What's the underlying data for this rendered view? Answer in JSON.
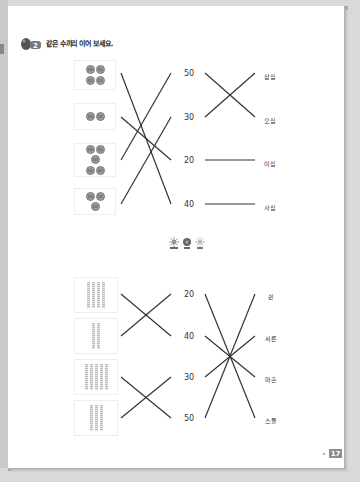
{
  "instruction": {
    "badge_number": "2",
    "text": "같은 수끼리 이어 보세요."
  },
  "section_top": {
    "boxes": [
      {
        "coin_count": 4,
        "coin_label": "10",
        "value": 40
      },
      {
        "coin_count": 2,
        "coin_label": "10",
        "value": 20
      },
      {
        "coin_count": 5,
        "coin_label": "10",
        "value": 50
      },
      {
        "coin_count": 3,
        "coin_label": "10",
        "value": 30
      }
    ],
    "numbers": [
      "50",
      "30",
      "20",
      "40"
    ],
    "words": [
      "삼십",
      "오십",
      "이십",
      "사십"
    ],
    "box_to_number": [
      [
        0,
        3
      ],
      [
        1,
        2
      ],
      [
        2,
        0
      ],
      [
        3,
        1
      ]
    ],
    "number_to_word": [
      [
        0,
        1
      ],
      [
        1,
        0
      ],
      [
        2,
        2
      ],
      [
        3,
        3
      ]
    ]
  },
  "section_bottom": {
    "boxes": [
      {
        "stick_count": 4,
        "value": 40
      },
      {
        "stick_count": 2,
        "value": 20
      },
      {
        "stick_count": 5,
        "value": 50
      },
      {
        "stick_count": 3,
        "value": 30
      }
    ],
    "numbers": [
      "20",
      "40",
      "30",
      "50"
    ],
    "words": [
      "쉰",
      "서른",
      "마흔",
      "스물"
    ],
    "box_to_number": [
      [
        0,
        1
      ],
      [
        1,
        0
      ],
      [
        2,
        3
      ],
      [
        3,
        2
      ]
    ],
    "number_to_word": [
      [
        0,
        3
      ],
      [
        1,
        2
      ],
      [
        2,
        1
      ],
      [
        3,
        0
      ]
    ]
  },
  "divider_icon": "three-flowers-icon",
  "page_number": "17",
  "colors": {
    "line": "#333333",
    "coin": "#9a9a9a",
    "page_number_bg": "#8e8e8e"
  }
}
